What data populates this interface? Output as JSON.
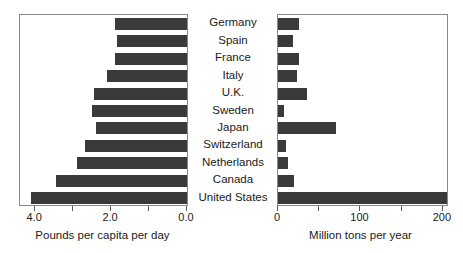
{
  "chart_data": [
    {
      "type": "bar",
      "orientation": "horizontal",
      "id": "pounds-per-capita-per-day",
      "title": "",
      "xlabel": "Pounds per capita per day",
      "ylabel": "",
      "xlim": [
        4.4,
        0.0
      ],
      "x_axis_reversed": true,
      "grid": false,
      "legend": null,
      "tick_values": [
        4.0,
        3.0,
        2.0,
        1.0,
        0.0
      ],
      "tick_labels": [
        "4.0",
        "",
        "2.0",
        "",
        "0.0"
      ],
      "categories": [
        "Germany",
        "Spain",
        "France",
        "Italy",
        "U.K.",
        "Sweden",
        "Japan",
        "Switzerland",
        "Netherlands",
        "Canada",
        "United States"
      ],
      "values": [
        1.9,
        1.85,
        1.9,
        2.1,
        2.45,
        2.5,
        2.4,
        2.7,
        2.9,
        3.45,
        4.1
      ],
      "bar_color": "#3a3a3a"
    },
    {
      "type": "bar",
      "orientation": "horizontal",
      "id": "million-tons-per-year",
      "title": "",
      "xlabel": "Million tons per year",
      "ylabel": "",
      "xlim": [
        0,
        205
      ],
      "x_axis_reversed": false,
      "grid": false,
      "legend": null,
      "tick_values": [
        0,
        50,
        100,
        150,
        200
      ],
      "tick_labels": [
        "0",
        "",
        "100",
        "",
        "200"
      ],
      "categories": [
        "Germany",
        "Spain",
        "France",
        "Italy",
        "U.K.",
        "Sweden",
        "Japan",
        "Switzerland",
        "Netherlands",
        "Canada",
        "United States"
      ],
      "values": [
        26,
        18,
        25,
        23,
        35,
        7,
        70,
        10,
        12,
        20,
        205
      ],
      "bar_color": "#3a3a3a"
    }
  ],
  "left_chart": {
    "axis_title": "Pounds per capita per day",
    "ticks": [
      {
        "value": 4.0,
        "label": "4.0"
      },
      {
        "value": 3.0,
        "label": ""
      },
      {
        "value": 2.0,
        "label": "2.0"
      },
      {
        "value": 1.0,
        "label": ""
      },
      {
        "value": 0.0,
        "label": "0.0"
      }
    ]
  },
  "right_chart": {
    "axis_title": "Million tons per year",
    "ticks": [
      {
        "value": 0,
        "label": "0"
      },
      {
        "value": 50,
        "label": ""
      },
      {
        "value": 100,
        "label": "100"
      },
      {
        "value": 150,
        "label": ""
      },
      {
        "value": 200,
        "label": "200"
      }
    ]
  },
  "categories": [
    "Germany",
    "Spain",
    "France",
    "Italy",
    "U.K.",
    "Sweden",
    "Japan",
    "Switzerland",
    "Netherlands",
    "Canada",
    "United States"
  ],
  "colors": {
    "bar": "#3a3a3a",
    "frame": "#8a8a8a",
    "text": "#1a1a1a",
    "background": "#ffffff"
  }
}
